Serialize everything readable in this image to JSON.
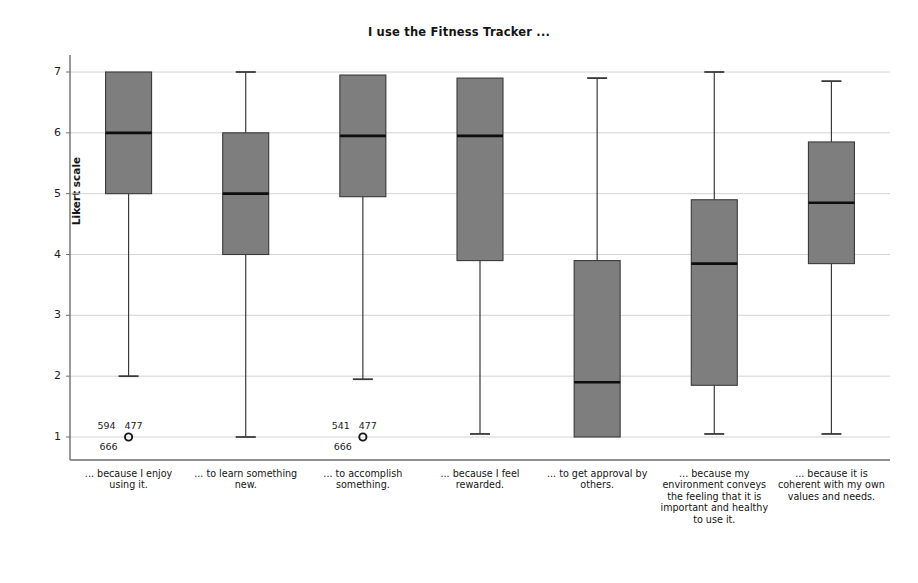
{
  "chart_data": {
    "type": "box",
    "title": "I use the Fitness Tracker ...",
    "xlabel": "",
    "ylabel": "Likert scale",
    "ylim": [
      0.55,
      7.45
    ],
    "yticks": [
      1,
      2,
      3,
      4,
      5,
      6,
      7
    ],
    "ytick_labels": [
      "1",
      "2",
      "3",
      "4",
      "5",
      "6",
      "7"
    ],
    "grid": "horizontal",
    "legend": "none",
    "box_fill": "#7e7e7e",
    "box_edge": "#3a3a3a",
    "median_color": "#0d0d0d",
    "whisker_color": "#3a3a3a",
    "gridline_color": "#cfcfcf",
    "axis_color": "#6e6e6e",
    "categories": [
      "... because I enjoy using it.",
      "... to learn something new.",
      "... to accomplish something.",
      "... because I feel rewarded.",
      "... to get approval by others.",
      "... because my environment conveys the feeling that it is important and healthy to use it.",
      "... because it is coherent with my own values and needs."
    ],
    "boxes": [
      {
        "category": "... because I enjoy using it.",
        "whisker_low": 2.0,
        "q1": 5.0,
        "median": 6.0,
        "q3": 7.0,
        "whisker_high": 7.0,
        "outliers": [
          {
            "value": 1.0,
            "labels_above": [
              "594",
              "477"
            ],
            "labels_below": [
              "666"
            ]
          }
        ]
      },
      {
        "category": "... to learn something new.",
        "whisker_low": 1.0,
        "q1": 4.0,
        "median": 5.0,
        "q3": 6.0,
        "whisker_high": 7.0,
        "outliers": []
      },
      {
        "category": "... to accomplish something.",
        "whisker_low": 1.95,
        "q1": 4.95,
        "median": 5.95,
        "q3": 6.95,
        "whisker_high": 6.95,
        "outliers": [
          {
            "value": 1.0,
            "labels_above": [
              "541",
              "477"
            ],
            "labels_below": [
              "666"
            ]
          }
        ]
      },
      {
        "category": "... because I feel rewarded.",
        "whisker_low": 1.05,
        "q1": 3.9,
        "median": 5.95,
        "q3": 6.9,
        "whisker_high": 6.9,
        "outliers": []
      },
      {
        "category": "... to get approval by others.",
        "whisker_low": 1.0,
        "q1": 1.0,
        "median": 1.9,
        "q3": 3.9,
        "whisker_high": 6.9,
        "outliers": []
      },
      {
        "category": "... because my environment conveys the feeling that it is important and healthy to use it.",
        "whisker_low": 1.05,
        "q1": 1.85,
        "median": 3.85,
        "q3": 4.9,
        "whisker_high": 7.0,
        "outliers": []
      },
      {
        "category": "... because it is coherent with my own values and needs.",
        "whisker_low": 1.05,
        "q1": 3.85,
        "median": 4.85,
        "q3": 5.85,
        "whisker_high": 6.85,
        "outliers": []
      }
    ]
  }
}
